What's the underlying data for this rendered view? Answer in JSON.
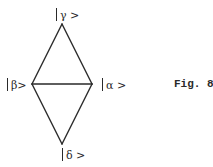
{
  "figure": {
    "caption": "Fig. 8",
    "stroke_color": "#2a2a2a",
    "background": "#ffffff"
  },
  "nodes": {
    "top": {
      "label": "γ >",
      "x": 62,
      "y": 24
    },
    "left": {
      "label": "β>",
      "x": 32,
      "y": 84
    },
    "right": {
      "label": "α >",
      "x": 92,
      "y": 84
    },
    "bottom": {
      "label": "δ >",
      "x": 62,
      "y": 144
    }
  },
  "edges": [
    {
      "from": "top",
      "to": "left"
    },
    {
      "from": "top",
      "to": "right"
    },
    {
      "from": "left",
      "to": "right"
    },
    {
      "from": "left",
      "to": "bottom"
    },
    {
      "from": "right",
      "to": "bottom"
    }
  ]
}
